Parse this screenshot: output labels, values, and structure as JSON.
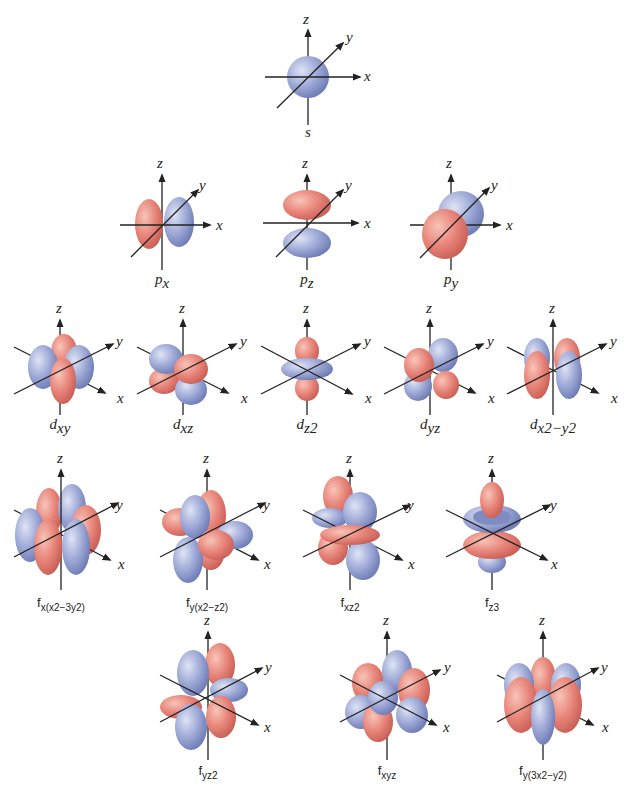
{
  "colors": {
    "positive_lobe": "#e8857a",
    "negative_lobe": "#9aa6d4",
    "axis": "#222222",
    "background": "#ffffff"
  },
  "axes_labels": {
    "x": "x",
    "y": "y",
    "z": "z"
  },
  "rows": [
    {
      "name": "s",
      "orbitals": [
        {
          "id": "s",
          "label_main": "s",
          "label_sub": ""
        }
      ]
    },
    {
      "name": "p",
      "orbitals": [
        {
          "id": "px",
          "label_main": "p",
          "label_sub": "x"
        },
        {
          "id": "pz",
          "label_main": "p",
          "label_sub": "z"
        },
        {
          "id": "py",
          "label_main": "p",
          "label_sub": "y"
        }
      ]
    },
    {
      "name": "d",
      "orbitals": [
        {
          "id": "dxy",
          "label_main": "d",
          "label_sub": "xy"
        },
        {
          "id": "dxz",
          "label_main": "d",
          "label_sub": "xz"
        },
        {
          "id": "dz2",
          "label_main": "d",
          "label_sub": "z2"
        },
        {
          "id": "dyz",
          "label_main": "d",
          "label_sub": "yz"
        },
        {
          "id": "dx2y2",
          "label_main": "d",
          "label_sub": "x2−y2"
        }
      ]
    },
    {
      "name": "f1",
      "orbitals": [
        {
          "id": "fx(x2-3y2)",
          "label_main": "f",
          "label_sub": "x(x2−3y2)"
        },
        {
          "id": "fy(x2-z2)",
          "label_main": "f",
          "label_sub": "y(x2−z2)"
        },
        {
          "id": "fxz2",
          "label_main": "f",
          "label_sub": "xz2"
        },
        {
          "id": "fz3",
          "label_main": "f",
          "label_sub": "z3"
        }
      ]
    },
    {
      "name": "f2",
      "orbitals": [
        {
          "id": "fyz2",
          "label_main": "f",
          "label_sub": "yz2"
        },
        {
          "id": "fxyz",
          "label_main": "f",
          "label_sub": "xyz"
        },
        {
          "id": "fy(3x2-y2)",
          "label_main": "f",
          "label_sub": "y(3x2−y2)"
        }
      ]
    }
  ]
}
